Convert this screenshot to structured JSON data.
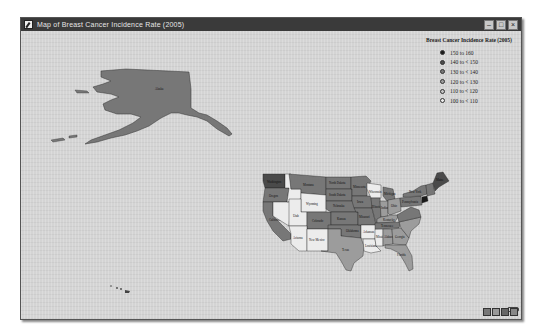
{
  "window": {
    "title": "Map of Breast Cancer Incidence Rate (2005)",
    "buttons": [
      {
        "name": "minimize",
        "glyph": "–"
      },
      {
        "name": "maximize",
        "glyph": "□"
      },
      {
        "name": "close",
        "glyph": "×"
      }
    ]
  },
  "legend": {
    "title": "Breast Cancer Incidence Rate (2005)",
    "items": [
      {
        "label": "150 to 160",
        "color": "#1a1a1a"
      },
      {
        "label": "140 to < 150",
        "color": "#4a4a4a"
      },
      {
        "label": "130 to < 140",
        "color": "#777777"
      },
      {
        "label": "120 to < 130",
        "color": "#9c9c9c"
      },
      {
        "label": "110 to < 120",
        "color": "#c4c4c4"
      },
      {
        "label": "100 to < 110",
        "color": "#ececec"
      }
    ]
  },
  "map": {
    "states": [
      {
        "name": "Alaska",
        "label": "Alaska"
      },
      {
        "name": "Washington",
        "label": "Washington"
      },
      {
        "name": "Oregon",
        "label": "Oregon"
      },
      {
        "name": "California",
        "label": "California"
      },
      {
        "name": "Montana",
        "label": "Montana"
      },
      {
        "name": "Wyoming",
        "label": "Wyoming"
      },
      {
        "name": "Utah",
        "label": "Utah"
      },
      {
        "name": "Colorado",
        "label": "Colorado"
      },
      {
        "name": "Arizona",
        "label": "Arizona"
      },
      {
        "name": "New Mexico",
        "label": "New Mexico"
      },
      {
        "name": "North Dakota",
        "label": "North Dakota"
      },
      {
        "name": "South Dakota",
        "label": "South Dakota"
      },
      {
        "name": "Nebraska",
        "label": "Nebraska"
      },
      {
        "name": "Kansas",
        "label": "Kansas"
      },
      {
        "name": "Oklahoma",
        "label": "Oklahoma"
      },
      {
        "name": "Texas",
        "label": "Texas"
      },
      {
        "name": "Minnesota",
        "label": "Minnesota"
      },
      {
        "name": "Iowa",
        "label": "Iowa"
      },
      {
        "name": "Missouri",
        "label": "Missouri"
      },
      {
        "name": "Arkansas",
        "label": "Arkansas"
      },
      {
        "name": "Louisiana",
        "label": "Louisiana"
      },
      {
        "name": "Wisconsin",
        "label": "Wisconsin"
      },
      {
        "name": "Illinois",
        "label": "Illinois"
      },
      {
        "name": "Michigan",
        "label": "Michigan"
      },
      {
        "name": "Indiana",
        "label": "Indiana"
      },
      {
        "name": "Ohio",
        "label": "Ohio"
      },
      {
        "name": "Kentucky",
        "label": "Kentucky"
      },
      {
        "name": "Tennessee",
        "label": "Tennessee"
      },
      {
        "name": "Mississippi",
        "label": "Mississippi"
      },
      {
        "name": "Alabama",
        "label": "Alabama"
      },
      {
        "name": "Georgia",
        "label": "Georgia"
      },
      {
        "name": "Florida",
        "label": "Florida"
      },
      {
        "name": "Pennsylvania",
        "label": "Pennsylvania"
      },
      {
        "name": "New York",
        "label": "New York"
      },
      {
        "name": "Maine",
        "label": "Maine"
      }
    ]
  },
  "scale_bar": {
    "icon": "scale-bar-icon"
  },
  "nav_tools": [
    {
      "name": "pan-tool",
      "icon": "hand-icon"
    },
    {
      "name": "zoom-in-tool",
      "icon": "zoom-in-icon"
    },
    {
      "name": "zoom-out-tool",
      "icon": "zoom-out-icon"
    },
    {
      "name": "full-extent-tool",
      "icon": "globe-icon"
    }
  ]
}
